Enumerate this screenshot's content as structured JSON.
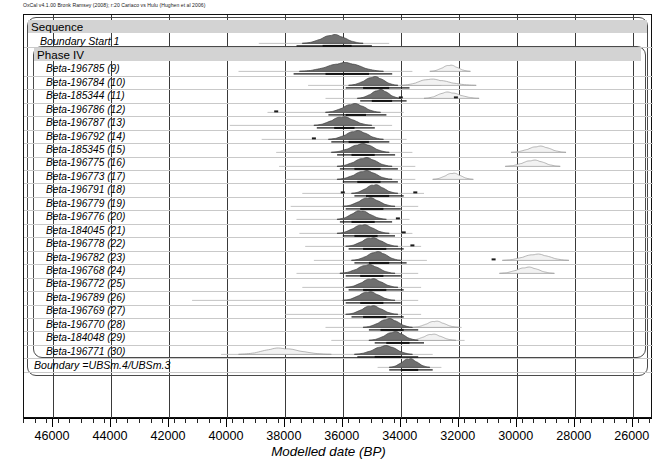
{
  "credit": "OxCal v4.1.00 Bronk Ramsey (2008); r:20 Cariaco vs Hulu (Hughen et al 2006)",
  "axis": {
    "title": "Modelled date (BP)",
    "tick_labels": [
      "46000",
      "44000",
      "42000",
      "40000",
      "38000",
      "36000",
      "34000",
      "32000",
      "30000",
      "28000",
      "26000"
    ],
    "tick_values": [
      46000,
      44000,
      42000,
      40000,
      38000,
      36000,
      34000,
      32000,
      30000,
      28000,
      26000
    ],
    "minor_step": 400,
    "range": [
      47000,
      25300
    ],
    "reversed": true
  },
  "colors": {
    "modelled_fill": "#6f6f6f",
    "modelled_edge": "#3c3c3c",
    "unmodelled_fill": "#f2f2f2",
    "unmodelled_edge": "#9a9a9a",
    "range_bar": "#111111",
    "grid": "#3a3a3a",
    "group_band": "#d3d3d3",
    "frame": "#101010"
  },
  "groups": [
    {
      "name": "Sequence",
      "label": "Sequence"
    },
    {
      "name": "Phase IV",
      "label": "Phase IV"
    }
  ],
  "rows": [
    {
      "label": "Sequence",
      "kind": "group"
    },
    {
      "label": "Boundary Start 1",
      "kind": "boundary"
    },
    {
      "label": "Phase IV",
      "kind": "group"
    },
    {
      "label": "Beta-196785 (9)",
      "kind": "date"
    },
    {
      "label": "Beta-196784 (10)",
      "kind": "date"
    },
    {
      "label": "Beta-185344 (11)",
      "kind": "date"
    },
    {
      "label": "Beta-196786 (12)",
      "kind": "date"
    },
    {
      "label": "Beta-196787 (13)",
      "kind": "date"
    },
    {
      "label": "Beta-196792 (14)",
      "kind": "date"
    },
    {
      "label": "Beta-185345 (15)",
      "kind": "date"
    },
    {
      "label": "Beta-196775 (16)",
      "kind": "date"
    },
    {
      "label": "Beta-196773 (17)",
      "kind": "date"
    },
    {
      "label": "Beta-196791 (18)",
      "kind": "date"
    },
    {
      "label": "Beta-196779 (19)",
      "kind": "date"
    },
    {
      "label": "Beta-196776 (20)",
      "kind": "date"
    },
    {
      "label": "Beta-184045 (21)",
      "kind": "date"
    },
    {
      "label": "Beta-196778 (22)",
      "kind": "date"
    },
    {
      "label": "Beta-196782 (23)",
      "kind": "date"
    },
    {
      "label": "Beta-196768 (24)",
      "kind": "date"
    },
    {
      "label": "Beta-196772 (25)",
      "kind": "date"
    },
    {
      "label": "Beta-196789 (26)",
      "kind": "date"
    },
    {
      "label": "Beta-196769 (27)",
      "kind": "date"
    },
    {
      "label": "Beta-196770 (28)",
      "kind": "date"
    },
    {
      "label": "Beta-184048 (29)",
      "kind": "date"
    },
    {
      "label": "Beta-196771 (30)",
      "kind": "date"
    },
    {
      "label": "Boundary =UBSm.4/UBSm.3",
      "kind": "boundary"
    }
  ],
  "chart_data": {
    "type": "area",
    "xlabel": "Modelled date (BP)",
    "ylabel": "",
    "xlim": [
      47000,
      25300
    ],
    "x_reversed": true,
    "grid": true,
    "legend": "none",
    "series": [
      {
        "name": "Boundary Start 1",
        "row": 1,
        "modelled": {
          "peak": 36300,
          "start": 37400,
          "end": 35300
        },
        "unmodelled": null,
        "range95": [
          37600,
          35000
        ],
        "range68": [
          36700,
          35700
        ],
        "tail": [
          38900,
          34400
        ]
      },
      {
        "name": "Beta-196785 (9)",
        "row": 3,
        "modelled": {
          "peak": 35900,
          "start": 37500,
          "end": 34600
        },
        "unmodelled": {
          "peak": 32300,
          "start": 33000,
          "end": 31600
        },
        "range95": [
          37700,
          34300
        ],
        "range68": [
          36600,
          35100
        ],
        "tail": [
          39600,
          33600
        ]
      },
      {
        "name": "Beta-196784 (10)",
        "row": 4,
        "modelled": {
          "peak": 34900,
          "start": 35800,
          "end": 34100
        },
        "unmodelled": {
          "peak": 33000,
          "start": 34000,
          "end": 31400
        },
        "range95": [
          35900,
          33700
        ],
        "range68": [
          35300,
          34400
        ],
        "tail": [
          37200,
          32600
        ]
      },
      {
        "name": "Beta-185344 (11)",
        "row": 5,
        "modelled": {
          "peak": 34700,
          "start": 35500,
          "end": 34000
        },
        "unmodelled": {
          "peak": 32400,
          "start": 33200,
          "end": 31300
        },
        "range95": [
          35400,
          33800
        ],
        "range68": [
          35000,
          34300
        ],
        "tail": [
          36600,
          32200
        ],
        "spots": [
          34000,
          32100
        ]
      },
      {
        "name": "Beta-196786 (12)",
        "row": 6,
        "modelled": {
          "peak": 35600,
          "start": 36600,
          "end": 34700
        },
        "unmodelled": null,
        "range95": [
          36500,
          34500
        ],
        "range68": [
          35900,
          35200
        ],
        "tail": [
          38600,
          33900
        ],
        "spots": [
          38300
        ]
      },
      {
        "name": "Beta-196787 (13)",
        "row": 7,
        "modelled": {
          "peak": 36000,
          "start": 37000,
          "end": 35000
        },
        "unmodelled": null,
        "range95": [
          36900,
          34900
        ],
        "range68": [
          36300,
          35600
        ],
        "tail": [
          39900,
          34300
        ]
      },
      {
        "name": "Beta-196792 (14)",
        "row": 8,
        "modelled": {
          "peak": 35500,
          "start": 36500,
          "end": 34600
        },
        "unmodelled": null,
        "range95": [
          36400,
          34400
        ],
        "range68": [
          35800,
          35100
        ],
        "tail": [
          38800,
          33800
        ],
        "spots": [
          37000
        ]
      },
      {
        "name": "Beta-185345 (15)",
        "row": 9,
        "modelled": {
          "peak": 35300,
          "start": 36400,
          "end": 34400
        },
        "unmodelled": {
          "peak": 29200,
          "start": 30200,
          "end": 28300
        },
        "range95": [
          36200,
          34200
        ],
        "range68": [
          35700,
          34900
        ],
        "tail": [
          38300,
          33600
        ]
      },
      {
        "name": "Beta-196775 (16)",
        "row": 10,
        "modelled": {
          "peak": 35200,
          "start": 36200,
          "end": 34300
        },
        "unmodelled": {
          "peak": 29400,
          "start": 30400,
          "end": 28500
        },
        "range95": [
          36100,
          34100
        ],
        "range68": [
          35600,
          34700
        ],
        "tail": [
          38200,
          33500
        ]
      },
      {
        "name": "Beta-196773 (17)",
        "row": 11,
        "modelled": {
          "peak": 35200,
          "start": 36200,
          "end": 34300
        },
        "unmodelled": {
          "peak": 32200,
          "start": 32900,
          "end": 31500
        },
        "range95": [
          36000,
          34100
        ],
        "range68": [
          35500,
          34700
        ],
        "tail": [
          38000,
          33500
        ]
      },
      {
        "name": "Beta-196791 (18)",
        "row": 12,
        "modelled": {
          "peak": 34900,
          "start": 35700,
          "end": 34100
        },
        "unmodelled": null,
        "range95": [
          35600,
          33900
        ],
        "range68": [
          35200,
          34400
        ],
        "tail": [
          37400,
          33200
        ],
        "spots": [
          36000,
          33500
        ]
      },
      {
        "name": "Beta-196779 (19)",
        "row": 13,
        "modelled": {
          "peak": 35100,
          "start": 36000,
          "end": 34200
        },
        "unmodelled": null,
        "range95": [
          35900,
          34000
        ],
        "range68": [
          35400,
          34600
        ],
        "tail": [
          37800,
          33400
        ]
      },
      {
        "name": "Beta-196776 (20)",
        "row": 14,
        "modelled": {
          "peak": 35400,
          "start": 36200,
          "end": 34500
        },
        "unmodelled": null,
        "range95": [
          36100,
          34300
        ],
        "range68": [
          35700,
          34900
        ],
        "tail": [
          37600,
          33700
        ],
        "spots": [
          34100
        ]
      },
      {
        "name": "Beta-184045 (21)",
        "row": 15,
        "modelled": {
          "peak": 35300,
          "start": 36200,
          "end": 34400
        },
        "unmodelled": null,
        "range95": [
          36000,
          34200
        ],
        "range68": [
          35600,
          34800
        ],
        "tail": [
          37500,
          33600
        ],
        "spots": [
          33900
        ]
      },
      {
        "name": "Beta-196778 (22)",
        "row": 16,
        "modelled": {
          "peak": 35000,
          "start": 35900,
          "end": 34100
        },
        "unmodelled": null,
        "range95": [
          35800,
          33900
        ],
        "range68": [
          35300,
          34500
        ],
        "tail": [
          37300,
          33300
        ],
        "spots": [
          33600
        ]
      },
      {
        "name": "Beta-196782 (23)",
        "row": 17,
        "modelled": {
          "peak": 34800,
          "start": 35700,
          "end": 34000
        },
        "unmodelled": {
          "peak": 29300,
          "start": 30500,
          "end": 28200
        },
        "range95": [
          35600,
          33800
        ],
        "range68": [
          35100,
          34400
        ],
        "tail": [
          37000,
          33100
        ],
        "spots": [
          30800
        ]
      },
      {
        "name": "Beta-196768 (24)",
        "row": 18,
        "modelled": {
          "peak": 35100,
          "start": 36100,
          "end": 34200
        },
        "unmodelled": {
          "peak": 29600,
          "start": 30600,
          "end": 28700
        },
        "range95": [
          35900,
          34000
        ],
        "range68": [
          35400,
          34600
        ],
        "tail": [
          37600,
          33400
        ]
      },
      {
        "name": "Beta-196772 (25)",
        "row": 19,
        "modelled": {
          "peak": 35000,
          "start": 35900,
          "end": 34100
        },
        "unmodelled": null,
        "range95": [
          35800,
          33900
        ],
        "range68": [
          35300,
          34500
        ],
        "tail": [
          37400,
          33300
        ]
      },
      {
        "name": "Beta-196789 (26)",
        "row": 20,
        "modelled": {
          "peak": 35100,
          "start": 36000,
          "end": 34200
        },
        "unmodelled": null,
        "range95": [
          35900,
          34000
        ],
        "range68": [
          35400,
          34600
        ],
        "tail": [
          41200,
          33400
        ]
      },
      {
        "name": "Beta-196769 (27)",
        "row": 21,
        "modelled": {
          "peak": 35000,
          "start": 35900,
          "end": 34100
        },
        "unmodelled": null,
        "range95": [
          35700,
          33900
        ],
        "range68": [
          35300,
          34500
        ],
        "tail": [
          38000,
          33300
        ]
      },
      {
        "name": "Beta-196770 (28)",
        "row": 22,
        "modelled": {
          "peak": 34400,
          "start": 35300,
          "end": 33600
        },
        "unmodelled": {
          "peak": 32800,
          "start": 33600,
          "end": 32000
        },
        "range95": [
          35100,
          33400
        ],
        "range68": [
          34700,
          33900
        ],
        "tail": [
          36600,
          31900
        ]
      },
      {
        "name": "Beta-184048 (29)",
        "row": 23,
        "modelled": {
          "peak": 34200,
          "start": 35100,
          "end": 33400
        },
        "unmodelled": {
          "peak": 32900,
          "start": 33700,
          "end": 32100
        },
        "range95": [
          34900,
          33200
        ],
        "range68": [
          34500,
          33700
        ],
        "tail": [
          36400,
          31800
        ]
      },
      {
        "name": "Beta-196771 (30)",
        "row": 24,
        "modelled": {
          "peak": 34500,
          "start": 35600,
          "end": 33600
        },
        "unmodelled": {
          "peak": 38200,
          "start": 39600,
          "end": 36400
        },
        "range95": [
          35500,
          33400
        ],
        "range68": [
          34900,
          34000
        ],
        "tail": [
          40200,
          32900
        ]
      },
      {
        "name": "Boundary =UBSm.4/UBSm.3",
        "row": 25,
        "modelled": {
          "peak": 33700,
          "start": 34400,
          "end": 33000
        },
        "unmodelled": null,
        "range95": [
          34400,
          32900
        ],
        "range68": [
          34000,
          33400
        ],
        "tail": [
          34800,
          32600
        ]
      }
    ]
  }
}
